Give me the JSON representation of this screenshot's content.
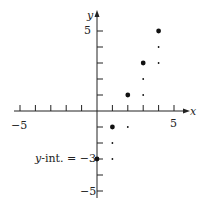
{
  "chart_data": {
    "type": "scatter",
    "title": "",
    "xlabel": "x",
    "ylabel": "y",
    "xlim": [
      -5,
      5
    ],
    "ylim": [
      -5,
      5
    ],
    "grid": false,
    "x_tick_labels": [
      "-5",
      "5"
    ],
    "y_tick_labels": [
      "5",
      "-5"
    ],
    "series": [
      {
        "name": "points",
        "marker": "large-dot",
        "x": [
          0,
          1,
          2,
          3,
          4
        ],
        "y": [
          -3,
          -1,
          1,
          3,
          5
        ]
      },
      {
        "name": "slope-steps",
        "marker": "small-dot",
        "x": [
          1,
          1,
          2,
          3,
          3,
          4,
          4
        ],
        "y": [
          -3,
          -2,
          -1,
          1,
          2,
          3,
          4
        ]
      }
    ],
    "annotations": [
      {
        "text": "y-int. = −3",
        "x": 0,
        "y": -3
      }
    ]
  },
  "labels": {
    "x_axis": "x",
    "y_axis": "y",
    "x_min": "−5",
    "x_max": "5",
    "y_max": "5",
    "y_min": "−5",
    "yint_prefix": "y",
    "yint_rest": "-int. = −3"
  }
}
